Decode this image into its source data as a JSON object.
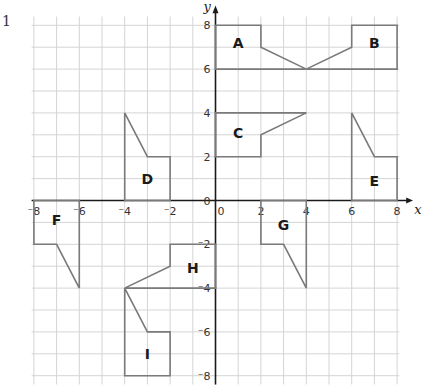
{
  "question_number": "1",
  "axes": {
    "x_label": "x",
    "y_label": "y",
    "x_range": [
      -8,
      8
    ],
    "y_range": [
      -8,
      8
    ],
    "x_ticks": [
      "-8",
      "-6",
      "-4",
      "-2",
      "0",
      "2",
      "4",
      "6",
      "8"
    ],
    "y_ticks": [
      "8",
      "6",
      "4",
      "2",
      "0",
      "-2",
      "-4",
      "-6",
      "-8"
    ],
    "grid": true,
    "grid_step": 1
  },
  "colors": {
    "grid": "#d4d4d4",
    "axis": "#1a1a1a",
    "shape": "#7a7a7a",
    "label": "#1a1a1a"
  },
  "shapes": [
    {
      "label": "A",
      "points": [
        [
          0,
          8
        ],
        [
          2,
          8
        ],
        [
          2,
          7
        ],
        [
          4,
          6
        ],
        [
          0,
          6
        ]
      ],
      "label_pos": [
        1,
        7.2
      ]
    },
    {
      "label": "B",
      "points": [
        [
          8,
          8
        ],
        [
          6,
          8
        ],
        [
          6,
          7
        ],
        [
          4,
          6
        ],
        [
          8,
          6
        ]
      ],
      "label_pos": [
        7,
        7.2
      ]
    },
    {
      "label": "C",
      "points": [
        [
          0,
          4
        ],
        [
          4,
          4
        ],
        [
          2,
          3
        ],
        [
          2,
          2
        ],
        [
          0,
          2
        ]
      ],
      "label_pos": [
        1,
        3.1
      ]
    },
    {
      "label": "D",
      "points": [
        [
          -4,
          0
        ],
        [
          -4,
          4
        ],
        [
          -3,
          2
        ],
        [
          -2,
          2
        ],
        [
          -2,
          0
        ]
      ],
      "label_pos": [
        -3,
        1
      ]
    },
    {
      "label": "E",
      "points": [
        [
          6,
          0
        ],
        [
          6,
          4
        ],
        [
          7,
          2
        ],
        [
          8,
          2
        ],
        [
          8,
          0
        ]
      ],
      "label_pos": [
        7,
        0.9
      ]
    },
    {
      "label": "F",
      "points": [
        [
          -8,
          0
        ],
        [
          -6,
          0
        ],
        [
          -6,
          -4
        ],
        [
          -7,
          -2
        ],
        [
          -8,
          -2
        ]
      ],
      "label_pos": [
        -7,
        -0.9
      ]
    },
    {
      "label": "G",
      "points": [
        [
          2,
          0
        ],
        [
          4,
          0
        ],
        [
          4,
          -4
        ],
        [
          3,
          -2
        ],
        [
          2,
          -2
        ]
      ],
      "label_pos": [
        3,
        -1.1
      ]
    },
    {
      "label": "H",
      "points": [
        [
          0,
          -2
        ],
        [
          -2,
          -2
        ],
        [
          -2,
          -3
        ],
        [
          -4,
          -4
        ],
        [
          0,
          -4
        ]
      ],
      "label_pos": [
        -1,
        -3.1
      ]
    },
    {
      "label": "I",
      "points": [
        [
          -4,
          -4
        ],
        [
          -3,
          -6
        ],
        [
          -2,
          -6
        ],
        [
          -2,
          -8
        ],
        [
          -4,
          -8
        ]
      ],
      "label_pos": [
        -3,
        -7
      ]
    }
  ]
}
